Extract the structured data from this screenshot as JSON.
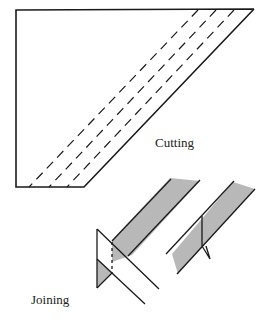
{
  "labels": {
    "cutting": "Cutting",
    "joining": "Joining"
  },
  "colors": {
    "stroke": "#1a1a1a",
    "fill": "#b8b8b8",
    "background": "#ffffff"
  }
}
